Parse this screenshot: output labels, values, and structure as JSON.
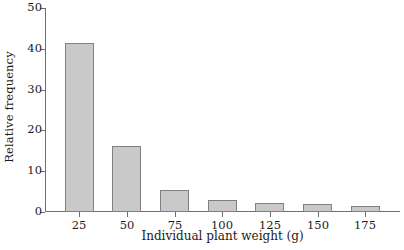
{
  "chart_data": {
    "type": "bar",
    "title": "",
    "xlabel": "Individual plant weight (g)",
    "ylabel": "Relative frequency",
    "categories": [
      "25",
      "50",
      "75",
      "100",
      "125",
      "150",
      "175"
    ],
    "values": [
      41.3,
      16.2,
      5.3,
      3.0,
      2.2,
      2.0,
      1.5
    ],
    "ylim": [
      0,
      50
    ],
    "yticks": [
      "0",
      "10",
      "20",
      "30",
      "40",
      "50"
    ],
    "ytick_values": [
      0,
      10,
      20,
      30,
      40,
      50
    ],
    "grid": false,
    "legend": false,
    "bar_fill_color": "#c9c9c9",
    "bar_border_color": "#808080",
    "axis_color": "#6e6e6e",
    "text_color": "#1a1a1a",
    "background_color": "#ffffff"
  }
}
